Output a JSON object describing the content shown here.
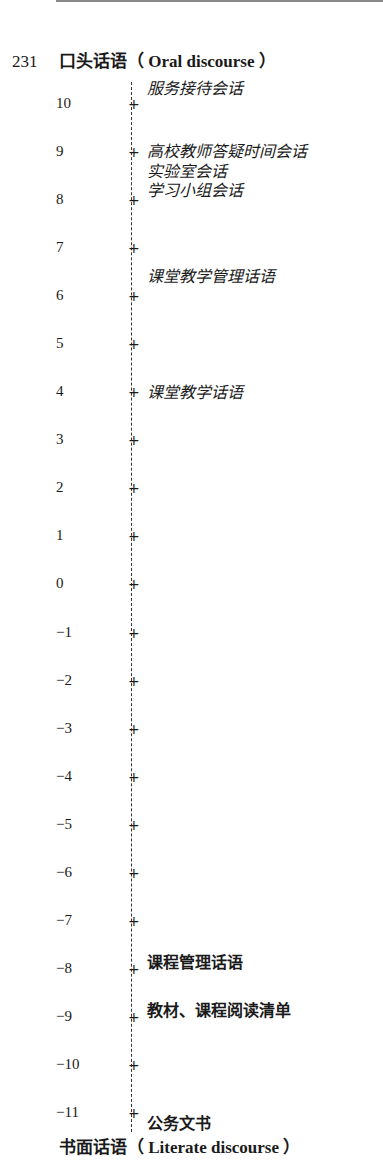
{
  "page": {
    "page_number": "231"
  },
  "diagram": {
    "title_top": "口头话语（ Oral discourse ）",
    "title_bottom": "书面话语（ Literate discourse ）",
    "axis": {
      "min": -11,
      "max": 10,
      "ticks": [
        "10",
        "9",
        "8",
        "7",
        "6",
        "5",
        "4",
        "3",
        "2",
        "1",
        "0",
        "−1",
        "−2",
        "−3",
        "−4",
        "−5",
        "−6",
        "−7",
        "−8",
        "−9",
        "−10",
        "−11"
      ]
    },
    "items": [
      {
        "label": "服务接待会话",
        "score": 10.5,
        "style": "italic"
      },
      {
        "label": "高校教师答疑时间会话",
        "score": 9,
        "style": "italic"
      },
      {
        "label": "实验室会话",
        "score": 8.4,
        "style": "italic"
      },
      {
        "label": "学习小组会话",
        "score": 8,
        "style": "italic"
      },
      {
        "label": "课堂教学管理话语",
        "score": 6.4,
        "style": "italic"
      },
      {
        "label": "课堂教学话语",
        "score": 4,
        "style": "italic"
      },
      {
        "label": "课程管理话语",
        "score": -8,
        "style": "bold"
      },
      {
        "label": "教材、课程阅读清单",
        "score": -9,
        "style": "bold"
      },
      {
        "label": "公务文书",
        "score": -11.4,
        "style": "bold"
      }
    ]
  },
  "chart_data": {
    "type": "scatter",
    "xlabel": "",
    "ylabel": "Dimension score (oral vs. literate)",
    "ylim": [
      -11,
      10
    ],
    "ticks": [
      10,
      9,
      8,
      7,
      6,
      5,
      4,
      3,
      2,
      1,
      0,
      -1,
      -2,
      -3,
      -4,
      -5,
      -6,
      -7,
      -8,
      -9,
      -10,
      -11
    ],
    "points": [
      {
        "label": "服务接待会话",
        "y": 10.5
      },
      {
        "label": "高校教师答疑时间会话",
        "y": 9.0
      },
      {
        "label": "实验室会话",
        "y": 8.4
      },
      {
        "label": "学习小组会话",
        "y": 8.0
      },
      {
        "label": "课堂教学管理话语",
        "y": 6.4
      },
      {
        "label": "课堂教学话语",
        "y": 4.0
      },
      {
        "label": "课程管理话语",
        "y": -8.0
      },
      {
        "label": "教材、课程阅读清单",
        "y": -9.0
      },
      {
        "label": "公务文书",
        "y": -11.4
      }
    ],
    "grid": false,
    "legend": "none"
  }
}
